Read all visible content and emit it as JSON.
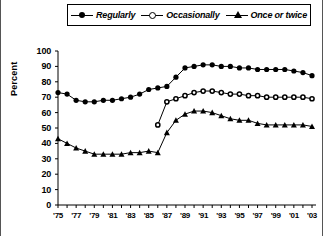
{
  "chart_data": {
    "type": "line",
    "title": "",
    "xlabel": "",
    "ylabel": "Percent",
    "ylim": [
      0,
      100
    ],
    "ytick_step": 10,
    "yticks": [
      0,
      10,
      20,
      30,
      40,
      50,
      60,
      70,
      80,
      90,
      100
    ],
    "grid": false,
    "legend_position": "top",
    "x": [
      1975,
      1976,
      1977,
      1978,
      1979,
      1980,
      1981,
      1982,
      1983,
      1984,
      1985,
      1986,
      1987,
      1988,
      1989,
      1990,
      1991,
      1992,
      1993,
      1994,
      1995,
      1996,
      1997,
      1998,
      1999,
      2000,
      2001,
      2002,
      2003
    ],
    "xtick_labels": [
      "'75",
      "'77",
      "'79",
      "'81",
      "'83",
      "'85",
      "'87",
      "'89",
      "'91",
      "'93",
      "'95",
      "'97",
      "'99",
      "'01",
      "'03"
    ],
    "xtick_label_years": [
      1975,
      1977,
      1979,
      1981,
      1983,
      1985,
      1987,
      1989,
      1991,
      1993,
      1995,
      1997,
      1999,
      2001,
      2003
    ],
    "series": [
      {
        "name": "Regularly",
        "marker": "filled-circle",
        "color": "#000000",
        "x": [
          1975,
          1976,
          1977,
          1978,
          1979,
          1980,
          1981,
          1982,
          1983,
          1984,
          1985,
          1986,
          1987,
          1988,
          1989,
          1990,
          1991,
          1992,
          1993,
          1994,
          1995,
          1996,
          1997,
          1998,
          1999,
          2000,
          2001,
          2002,
          2003
        ],
        "values": [
          73,
          72,
          68,
          67,
          67,
          68,
          68,
          69,
          70,
          72,
          75,
          76,
          77,
          83,
          89,
          90,
          91,
          91,
          90,
          90,
          89,
          89,
          88,
          88,
          88,
          88,
          87,
          86,
          84
        ]
      },
      {
        "name": "Occasionally",
        "marker": "open-circle",
        "color": "#000000",
        "x": [
          1986,
          1987,
          1988,
          1989,
          1990,
          1991,
          1992,
          1993,
          1994,
          1995,
          1996,
          1997,
          1998,
          1999,
          2000,
          2001,
          2002,
          2003
        ],
        "values": [
          52,
          67,
          69,
          71,
          73,
          74,
          74,
          73,
          72,
          72,
          71,
          71,
          70,
          70,
          70,
          70,
          70,
          69
        ]
      },
      {
        "name": "Once or twice",
        "marker": "filled-triangle",
        "color": "#000000",
        "x": [
          1975,
          1976,
          1977,
          1978,
          1979,
          1980,
          1981,
          1982,
          1983,
          1984,
          1985,
          1986,
          1987,
          1988,
          1989,
          1990,
          1991,
          1992,
          1993,
          1994,
          1995,
          1996,
          1997,
          1998,
          1999,
          2000,
          2001,
          2002,
          2003
        ],
        "values": [
          43,
          40,
          37,
          35,
          33,
          33,
          33,
          33,
          34,
          34,
          35,
          34,
          47,
          55,
          59,
          61,
          61,
          60,
          58,
          56,
          55,
          55,
          53,
          52,
          52,
          52,
          52,
          52,
          51
        ]
      }
    ]
  },
  "legend": {
    "items": [
      {
        "label": "Regularly",
        "marker": "filled-circle"
      },
      {
        "label": "Occasionally",
        "marker": "open-circle"
      },
      {
        "label": "Once or twice",
        "marker": "filled-triangle"
      }
    ]
  }
}
